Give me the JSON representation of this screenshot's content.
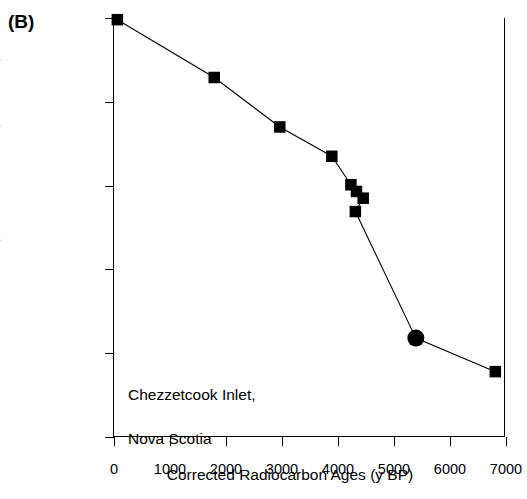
{
  "figure": {
    "panel_label": "(B)",
    "annotation": "Chezzetcook Inlet,\nNova Scotia",
    "annotation_line1": "Chezzetcook Inlet,",
    "annotation_line2": "Nova Scotia",
    "marker_color": "#000000",
    "line_color": "#000000",
    "axis_color": "#000000",
    "background_color": "#ffffff"
  },
  "chart_data": {
    "type": "line",
    "title": "",
    "subtitle": "",
    "xlabel": "Corrected Radiocarbon Ages (y BP)",
    "ylabel": "Depth below HHW (in meters)",
    "xlim": [
      0,
      7000
    ],
    "ylim": [
      0,
      25
    ],
    "y_inverted": true,
    "grid": false,
    "legend": null,
    "xticks": [
      0,
      1000,
      2000,
      3000,
      4000,
      5000,
      6000,
      7000
    ],
    "xtick_labels": [
      "0",
      "1000",
      "2000",
      "3000",
      "4000",
      "5000",
      "6000",
      "7000"
    ],
    "yticks": [
      0,
      5,
      10,
      15,
      20,
      25
    ],
    "ytick_labels": [
      "0",
      "5",
      "10",
      "15",
      "20",
      "25"
    ],
    "annotations": [
      "Chezzetcook Inlet,",
      "Nova Scotia"
    ],
    "series": [
      {
        "name": "Sea-level index points",
        "marker": "square",
        "line": "solid",
        "points": [
          {
            "x": 60,
            "y": 0.1,
            "marker": "square"
          },
          {
            "x": 1790,
            "y": 3.55,
            "marker": "square"
          },
          {
            "x": 2960,
            "y": 6.5,
            "marker": "square"
          },
          {
            "x": 3890,
            "y": 8.25,
            "marker": "square"
          },
          {
            "x": 4230,
            "y": 9.95,
            "marker": "square"
          },
          {
            "x": 4330,
            "y": 10.35,
            "marker": "square"
          },
          {
            "x": 4450,
            "y": 10.75,
            "marker": "square"
          },
          {
            "x": 4310,
            "y": 11.55,
            "marker": "square"
          },
          {
            "x": 5390,
            "y": 19.1,
            "marker": "circle"
          },
          {
            "x": 6810,
            "y": 21.1,
            "marker": "square"
          }
        ]
      }
    ]
  }
}
